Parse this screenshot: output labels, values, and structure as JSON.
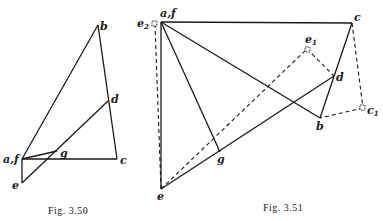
{
  "figures": [
    {
      "caption": "Fig. 3.50",
      "labels": {
        "b": "b",
        "d": "d",
        "af": "a,f",
        "g": "g",
        "c": "c",
        "e": "e"
      }
    },
    {
      "caption": "Fig. 3.51",
      "labels": {
        "e2": "e",
        "e2_sub": "2",
        "af": "a,f",
        "c": "c",
        "e1": "e",
        "e1_sub": "1",
        "d": "d",
        "b": "b",
        "c1": "c",
        "c1_sub": "1",
        "g": "g",
        "e": "e"
      }
    }
  ]
}
